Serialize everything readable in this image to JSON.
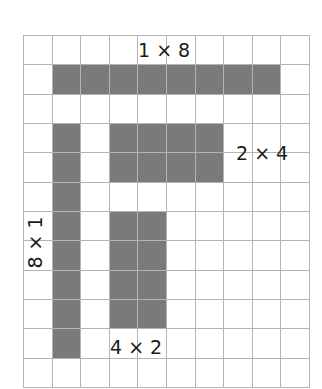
{
  "grid": {
    "cols": 10,
    "rows": 12,
    "line_color": "#b4b4b4",
    "fill_color": "#7a7a7a"
  },
  "shapes": [
    {
      "id": "rect-1x8",
      "label": "1 × 8",
      "row": 1,
      "col": 1,
      "rows": 1,
      "cols": 8
    },
    {
      "id": "rect-8x1",
      "label": "8 × 1",
      "row": 3,
      "col": 1,
      "rows": 8,
      "cols": 1
    },
    {
      "id": "rect-2x4",
      "label": "2 × 4",
      "row": 3,
      "col": 3,
      "rows": 2,
      "cols": 4
    },
    {
      "id": "rect-4x2",
      "label": "4 × 2",
      "row": 6,
      "col": 3,
      "rows": 4,
      "cols": 2
    }
  ],
  "labels": {
    "l1x8": "1 × 8",
    "l8x1": "8 × 1",
    "l2x4": "2 × 4",
    "l4x2": "4 × 2"
  }
}
